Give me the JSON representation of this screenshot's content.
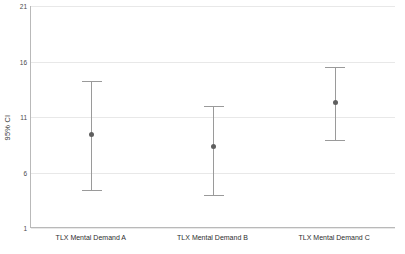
{
  "chart_data": {
    "type": "scatter",
    "title": "",
    "subtitle": "",
    "xlabel": "",
    "ylabel": "95% CI",
    "ylim": [
      1,
      21
    ],
    "yticks": [
      21,
      16,
      11,
      6,
      1
    ],
    "ytick_labels": [
      "21",
      "16",
      "11",
      "6",
      "1"
    ],
    "grid": true,
    "legend": false,
    "categories": [
      "TLX Mental Demand A",
      "TLX Mental Demand B",
      "TLX Mental Demand C"
    ],
    "series": [
      {
        "name": "Mean with 95% CI",
        "values": [
          9.4,
          8.3,
          12.3
        ],
        "ci_lower": [
          4.4,
          4.0,
          8.9
        ],
        "ci_upper": [
          14.2,
          12.0,
          15.5
        ]
      }
    ],
    "colors": {
      "point": "#5f5f5f",
      "whisker": "#9a9a9a",
      "gridline": "#e8e8e8",
      "axis": "#b9b9b9",
      "text": "#2e2e2e",
      "background": "#ffffff"
    }
  },
  "axis": {
    "y_title": "95% CI"
  }
}
